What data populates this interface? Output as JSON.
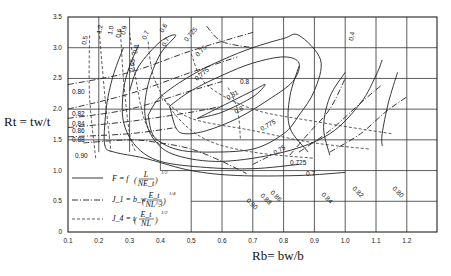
{
  "chart_data": {
    "type": "line",
    "title": "",
    "xlabel": "R_b = b_w/b",
    "ylabel": "R_t = t_w/t",
    "xlim": [
      0.1,
      1.29
    ],
    "ylim": [
      0,
      3.5
    ],
    "grid": true,
    "x_ticks": [
      "0.1",
      "0.2",
      "0.3",
      "0.4",
      "0.5",
      "0.6",
      "0.7",
      "0.8",
      "0.9",
      "1.0",
      "1.1",
      "1.2"
    ],
    "y_ticks": [
      "0",
      "0.5",
      "1.0",
      "1.5",
      "2.0",
      "2.5",
      "3.0",
      "3.5"
    ],
    "legend": {
      "placement": "bottom-left",
      "entries": [
        {
          "style": "solid",
          "text": "F = f (L / NE_t)^(1/2)",
          "lhs": "F = f",
          "num": "L",
          "den": "NE_t",
          "exp": "1/2"
        },
        {
          "style": "dash-dot",
          "text": "J_1 = b_w (E_t / NL^3)^(1/4)",
          "lhs": "J_1 = b_w",
          "num": "E_t",
          "den": "NL^3",
          "exp": "1/4"
        },
        {
          "style": "dashed",
          "text": "J_4 = t (E_t / NL)^(1/2)",
          "lhs": "J_4 = t",
          "num": "E_t",
          "den": "NL",
          "exp": "1/2"
        }
      ]
    },
    "series": [
      {
        "name": "F = 0.80",
        "style": "solid",
        "label": "0.8",
        "points": [
          [
            0.43,
            2.05
          ],
          [
            0.5,
            2.3
          ],
          [
            0.6,
            2.55
          ],
          [
            0.7,
            2.75
          ],
          [
            0.8,
            2.85
          ],
          [
            0.85,
            2.75
          ],
          [
            0.83,
            2.45
          ],
          [
            0.75,
            2.15
          ],
          [
            0.65,
            1.85
          ],
          [
            0.55,
            1.65
          ],
          [
            0.48,
            1.6
          ],
          [
            0.45,
            1.7
          ],
          [
            0.43,
            2.05
          ]
        ]
      },
      {
        "name": "F = 0.81",
        "style": "solid",
        "label": "0.81",
        "points": [
          [
            0.52,
            1.85
          ],
          [
            0.6,
            2.05
          ],
          [
            0.7,
            2.3
          ],
          [
            0.74,
            2.4
          ],
          [
            0.7,
            2.2
          ],
          [
            0.6,
            1.95
          ],
          [
            0.52,
            1.85
          ]
        ]
      },
      {
        "name": "F = 0.775",
        "style": "solid",
        "label": "0.775",
        "points": [
          [
            0.36,
            1.9
          ],
          [
            0.4,
            2.2
          ],
          [
            0.5,
            2.55
          ],
          [
            0.6,
            2.8
          ],
          [
            0.7,
            3.0
          ],
          [
            0.8,
            3.15
          ],
          [
            0.85,
            3.2
          ],
          [
            0.92,
            2.8
          ],
          [
            0.9,
            2.3
          ],
          [
            0.85,
            1.9
          ],
          [
            0.8,
            1.6
          ],
          [
            0.7,
            1.35
          ],
          [
            0.55,
            1.3
          ],
          [
            0.45,
            1.35
          ],
          [
            0.38,
            1.55
          ],
          [
            0.36,
            1.9
          ]
        ]
      },
      {
        "name": "F = 0.75",
        "style": "solid",
        "label": "0.75",
        "points": [
          [
            0.3,
            2.3
          ],
          [
            0.33,
            2.7
          ],
          [
            0.4,
            3.1
          ],
          [
            0.45,
            3.2
          ],
          [
            0.4,
            2.9
          ],
          [
            0.36,
            2.4
          ],
          [
            0.35,
            1.9
          ],
          [
            0.38,
            1.5
          ],
          [
            0.45,
            1.25
          ],
          [
            0.6,
            1.15
          ],
          [
            0.8,
            1.3
          ],
          [
            0.95,
            1.6
          ],
          [
            1.05,
            2.1
          ],
          [
            1.1,
            2.55
          ],
          [
            1.12,
            2.8
          ]
        ]
      },
      {
        "name": "F = 0.725",
        "style": "solid",
        "label": "0.725",
        "points": [
          [
            0.33,
            3.05
          ],
          [
            0.3,
            2.7
          ],
          [
            0.28,
            2.3
          ],
          [
            0.28,
            1.8
          ],
          [
            0.32,
            1.4
          ],
          [
            0.4,
            1.15
          ],
          [
            0.55,
            1.05
          ],
          [
            0.7,
            1.03
          ],
          [
            0.85,
            1.1
          ]
        ]
      },
      {
        "name": "F = 0.70",
        "style": "solid",
        "label": "0.7",
        "points": [
          [
            0.28,
            3.0
          ],
          [
            0.25,
            2.6
          ],
          [
            0.23,
            2.2
          ],
          [
            0.22,
            1.8
          ],
          [
            0.22,
            1.4
          ],
          [
            0.25,
            1.3
          ],
          [
            0.35,
            1.2
          ],
          [
            0.5,
            1.0
          ],
          [
            0.65,
            0.92
          ],
          [
            0.85,
            0.92
          ],
          [
            1.0,
            0.97
          ]
        ]
      },
      {
        "name": "J1 = 0.80",
        "style": "dash-dot",
        "label": "0.80",
        "points": [
          [
            0.1,
            2.4
          ],
          [
            0.3,
            2.6
          ],
          [
            0.5,
            2.95
          ],
          [
            0.7,
            3.25
          ]
        ]
      },
      {
        "name": "J1 = 0.82",
        "style": "dash-dot",
        "label": "0.82",
        "points": [
          [
            0.1,
            2.0
          ],
          [
            0.3,
            2.25
          ],
          [
            0.5,
            2.6
          ],
          [
            0.65,
            2.85
          ]
        ]
      },
      {
        "name": "J1 = 0.84",
        "style": "dash-dot",
        "label": "0.84",
        "points": [
          [
            0.1,
            1.85
          ],
          [
            0.3,
            2.0
          ],
          [
            0.5,
            2.3
          ],
          [
            0.6,
            2.45
          ]
        ]
      },
      {
        "name": "J1 = 0.86",
        "style": "dash-dot",
        "label": "0.86",
        "points": [
          [
            0.1,
            1.7
          ],
          [
            0.3,
            1.8
          ],
          [
            0.5,
            1.95
          ],
          [
            0.6,
            2.05
          ]
        ]
      },
      {
        "name": "J1 = 0.88",
        "style": "dash-dot",
        "label": "0.88",
        "points": [
          [
            0.1,
            1.55
          ],
          [
            0.3,
            1.6
          ],
          [
            0.45,
            1.7
          ]
        ]
      },
      {
        "name": "J1 = 0.90",
        "style": "dash-dot",
        "label": "0.90",
        "points": [
          [
            0.15,
            1.45
          ],
          [
            0.3,
            1.5
          ],
          [
            0.4,
            1.45
          ],
          [
            0.5,
            1.35
          ],
          [
            0.6,
            1.15
          ],
          [
            0.68,
            0.95
          ]
        ]
      },
      {
        "name": "J4 = 0.5",
        "style": "dashed",
        "label": "0.5",
        "points": [
          [
            0.17,
            3.2
          ],
          [
            0.17,
            2.2
          ],
          [
            0.19,
            1.2
          ]
        ]
      },
      {
        "name": "J4 = 1.2",
        "style": "dashed",
        "label": "1.2",
        "points": [
          [
            0.2,
            3.35
          ],
          [
            0.22,
            2.2
          ],
          [
            0.24,
            1.3
          ]
        ]
      }
    ],
    "contour_labels": [
      "0.5",
      "1.2",
      "1.0",
      "0.6",
      "0.9",
      "0.65",
      "0.8",
      "0.7",
      "0.7",
      "0.6",
      "0.725",
      "0.75",
      "0.775",
      "0.8",
      "0.81",
      "0.8",
      "0.775",
      "0.75",
      "0.725",
      "0.7",
      "0.90",
      "0.88",
      "0.86",
      "0.84",
      "0.82",
      "0.80",
      "0.80",
      "0.82",
      "0.84",
      "0.86",
      "0.88",
      "0.90",
      "0.4"
    ]
  }
}
